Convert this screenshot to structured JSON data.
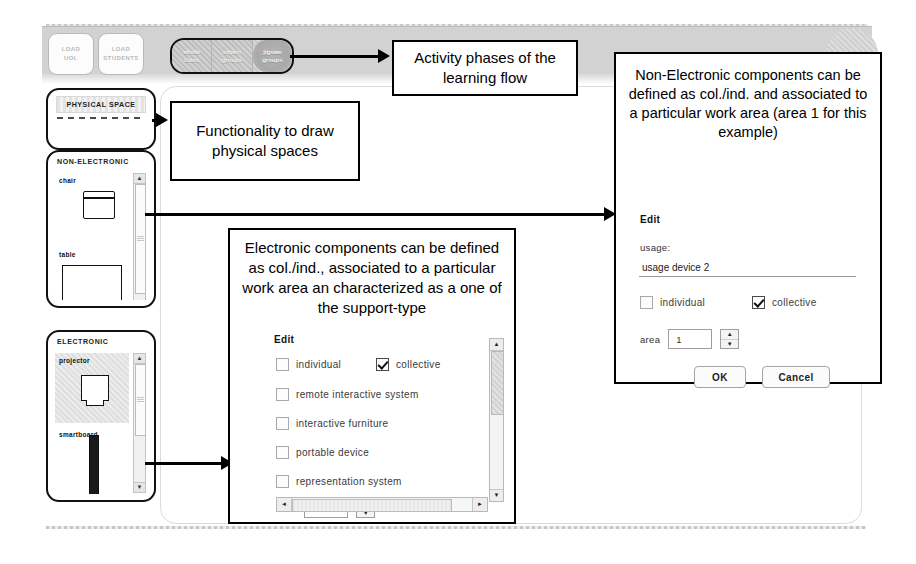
{
  "app": {
    "toolbar": {
      "load_buttons": [
        {
          "line1": "LOAD",
          "line2": "UOL"
        },
        {
          "line1": "LOAD",
          "line2": "STUDENTS"
        }
      ],
      "phase_tabs": [
        {
          "line1": "whole",
          "line2": "class",
          "active": false
        },
        {
          "line1": "expert",
          "line2": "groups",
          "active": false
        },
        {
          "line1": "jigsaw",
          "line2": "groups",
          "active": true
        }
      ]
    },
    "palettes": [
      {
        "title": "PHYSICAL SPACE",
        "items": []
      },
      {
        "title": "NON-ELECTRONIC",
        "items": [
          {
            "label": "chair"
          },
          {
            "label": "table"
          }
        ]
      },
      {
        "title": "ELECTRONIC",
        "items": [
          {
            "label": "projector"
          },
          {
            "label": "smartboard"
          }
        ]
      }
    ]
  },
  "annotations": {
    "phases": "Activity phases of the learning flow",
    "functionality": "Functionality to draw physical spaces",
    "electronic": "Electronic components can be defined as col./ind., associated to a particular work area an characterized as a one of the support-type",
    "non_electronic": "Non-Electronic components can be defined as col./ind. and  associated to a particular work area (area 1 for this example)"
  },
  "electronic_dialog": {
    "edit_title": "Edit",
    "checkboxes": [
      {
        "label": "individual",
        "checked": false
      },
      {
        "label": "collective",
        "checked": true
      },
      {
        "label": "remote interactive system",
        "checked": false
      },
      {
        "label": "interactive furniture",
        "checked": false
      },
      {
        "label": "portable device",
        "checked": false
      },
      {
        "label": "representation system",
        "checked": false
      }
    ],
    "area_label": "area",
    "area_value": "1"
  },
  "non_electronic_dialog": {
    "edit_title": "Edit",
    "usage_label": "usage:",
    "usage_value": "usage device 2",
    "checkboxes": [
      {
        "label": "individual",
        "checked": false
      },
      {
        "label": "collective",
        "checked": true
      }
    ],
    "area_label": "area",
    "area_value": "1",
    "ok_label": "OK",
    "cancel_label": "Cancel"
  },
  "icons": {
    "spin_up": "▲",
    "spin_down": "▼",
    "scroll_up": "▲",
    "scroll_down": "▼",
    "scroll_left": "◄",
    "scroll_right": "►"
  },
  "colors": {
    "annotation_border": "#000000",
    "panel_border": "#111111",
    "toolbar_band": "#d2d2d2",
    "canvas": "#ffffff"
  }
}
